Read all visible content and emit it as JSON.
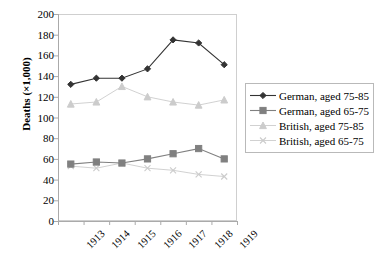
{
  "chart_data": {
    "type": "line",
    "title": "",
    "xlabel": "",
    "ylabel": "Deaths (×1,000)",
    "categories": [
      "1913",
      "1914",
      "1915",
      "1916",
      "1917",
      "1918",
      "1919"
    ],
    "ylim": [
      0,
      200
    ],
    "yticks": [
      0,
      20,
      40,
      60,
      80,
      100,
      120,
      140,
      160,
      180,
      200
    ],
    "grid": false,
    "legend_position": "right",
    "series": [
      {
        "name": "German, aged 75-85",
        "marker": "diamond",
        "color": "#333333",
        "values": [
          132,
          138,
          138,
          147,
          175,
          172,
          151
        ]
      },
      {
        "name": "German, aged 65-75",
        "marker": "square",
        "color": "#808080",
        "values": [
          55,
          57,
          56,
          60,
          65,
          70,
          60
        ]
      },
      {
        "name": "British, aged 75-85",
        "marker": "triangle",
        "color": "#cccccc",
        "values": [
          113,
          115,
          130,
          120,
          115,
          112,
          117
        ]
      },
      {
        "name": "British, aged 65-75",
        "marker": "cross",
        "color": "#cccccc",
        "values": [
          53,
          51,
          56,
          51,
          49,
          45,
          43
        ]
      }
    ]
  },
  "axis": {
    "y_title": "Deaths (×1,000)",
    "y_tick_labels": [
      "200",
      "180",
      "160",
      "140",
      "120",
      "100",
      "80",
      "60",
      "40",
      "20",
      "0"
    ],
    "x_tick_labels": [
      "1913",
      "1914",
      "1915",
      "1916",
      "1917",
      "1918",
      "1919"
    ]
  },
  "legend": {
    "items": [
      {
        "label": "German, aged 75-85"
      },
      {
        "label": "German, aged 65-75"
      },
      {
        "label": "British, aged 75-85"
      },
      {
        "label": "British, aged 65-75"
      }
    ]
  },
  "caption": {
    "text": ""
  },
  "colors": {
    "series1": "#333333",
    "series2": "#808080",
    "series3": "#cccccc",
    "series4": "#cccccc",
    "axis": "#aaaaaa",
    "plot_border": "#cfcfcf",
    "background": "#ffffff"
  }
}
